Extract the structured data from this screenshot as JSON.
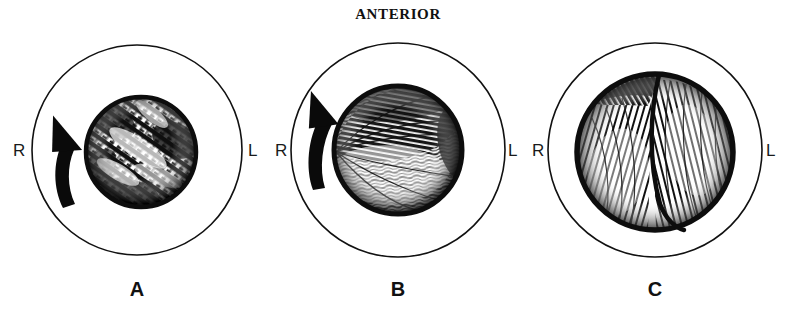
{
  "figure": {
    "title": "ANTERIOR",
    "background_color": "#ffffff",
    "ink_color": "#111111",
    "width": 792,
    "height": 315
  },
  "panels": [
    {
      "id": "A",
      "label": "A",
      "left_label": "R",
      "right_label": "L",
      "outer_circle": {
        "cx": 137,
        "cy": 150,
        "r": 105
      },
      "inner_ball": {
        "cx": 141,
        "cy": 152,
        "r": 55
      },
      "rotation_arrow": {
        "present": true,
        "direction": "counterclockwise",
        "cx": 72,
        "cy": 160
      },
      "fissure_line": false
    },
    {
      "id": "B",
      "label": "B",
      "left_label": "R",
      "right_label": "L",
      "outer_circle": {
        "cx": 398,
        "cy": 150,
        "r": 107
      },
      "inner_ball": {
        "cx": 398,
        "cy": 150,
        "r": 64
      },
      "rotation_arrow": {
        "present": true,
        "direction": "counterclockwise",
        "cx": 322,
        "cy": 147
      },
      "fissure_line": false
    },
    {
      "id": "C",
      "label": "C",
      "left_label": "R",
      "right_label": "L",
      "outer_circle": {
        "cx": 655,
        "cy": 150,
        "r": 107
      },
      "inner_ball": {
        "cx": 655,
        "cy": 152,
        "r": 78
      },
      "rotation_arrow": {
        "present": false,
        "direction": "",
        "cx": 0,
        "cy": 0
      },
      "fissure_line": true
    }
  ],
  "labels": {
    "title_x": 398,
    "title_y": 19,
    "side_label_y": 156,
    "panel_label_y": 296
  }
}
